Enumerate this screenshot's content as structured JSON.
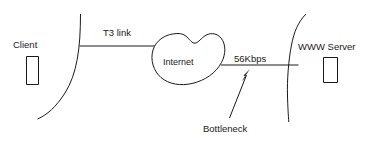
{
  "diagram": {
    "canvas": {
      "width": 377,
      "height": 141,
      "background": "#ffffff"
    },
    "stroke_color": "#1a1a1a",
    "text_color": "#1a1a1a",
    "nodes": {
      "client": {
        "label": "Client",
        "shape": "rectangle-outline"
      },
      "internet": {
        "label": "Internet",
        "shape": "cloud"
      },
      "server": {
        "label": "WWW Server",
        "shape": "rectangle-outline"
      }
    },
    "links": {
      "t3": {
        "label": "T3 link",
        "from": "client-network",
        "to": "internet"
      },
      "slow": {
        "label": "56Kbps",
        "from": "internet",
        "to": "server-network"
      }
    },
    "annotation": {
      "label": "Bottleneck",
      "points_at": "56Kbps",
      "marker": "arrow"
    }
  }
}
